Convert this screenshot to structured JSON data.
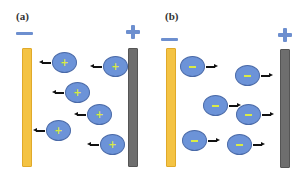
{
  "panels": [
    {
      "label": "(a)",
      "left_electrode": {
        "polarity": "negative",
        "symbol": "minus-sign",
        "color": "#f4c343"
      },
      "right_electrode": {
        "polarity": "positive",
        "symbol": "plus-sign",
        "color": "#6e6e6e"
      },
      "ion_charge": "+",
      "ion_motion": "toward negative electrode (left)",
      "ions": [
        {
          "cx": 64,
          "cy": 62
        },
        {
          "cx": 115,
          "cy": 66
        },
        {
          "cx": 77,
          "cy": 92
        },
        {
          "cx": 99,
          "cy": 114
        },
        {
          "cx": 58,
          "cy": 131
        },
        {
          "cx": 112,
          "cy": 144
        }
      ]
    },
    {
      "label": "(b)",
      "left_electrode": {
        "polarity": "negative",
        "symbol": "minus-sign",
        "color": "#f4c343"
      },
      "right_electrode": {
        "polarity": "positive",
        "symbol": "plus-sign",
        "color": "#6e6e6e"
      },
      "ion_charge": "-",
      "ion_motion": "toward positive electrode (right)",
      "ions": [
        {
          "cx": 193,
          "cy": 67
        },
        {
          "cx": 248,
          "cy": 76
        },
        {
          "cx": 216,
          "cy": 106
        },
        {
          "cx": 249,
          "cy": 115
        },
        {
          "cx": 195,
          "cy": 141
        },
        {
          "cx": 240,
          "cy": 145
        }
      ]
    }
  ],
  "colors": {
    "ion_fill": "#6c93d8",
    "ion_border": "#4a6aa8",
    "charge_symbol": "#d9ea45",
    "sign_blue": "#6d8fcf",
    "arrow": "#111111"
  }
}
